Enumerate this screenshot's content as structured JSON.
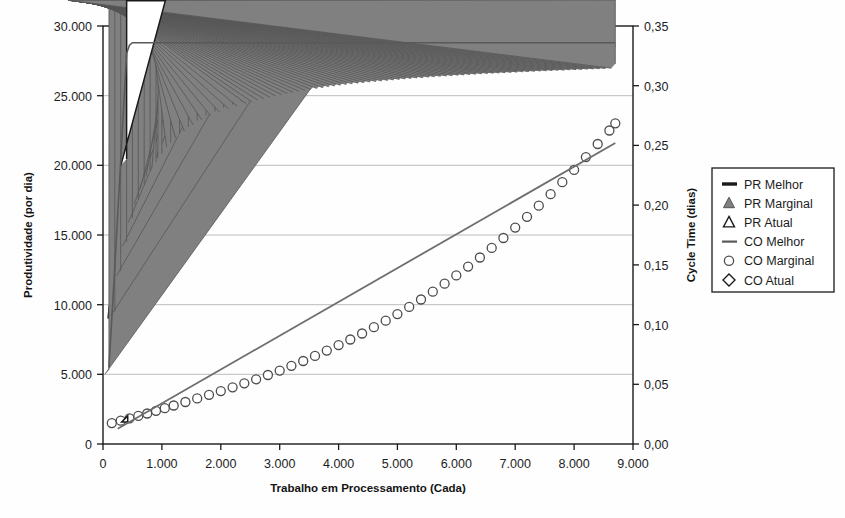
{
  "chart_data": {
    "type": "line",
    "title": "",
    "xlabel": "Trabalho em Processamento (Cada)",
    "ylabel": "Produtividade (por dia)",
    "y2label": "Cycle Time (dias)",
    "xlim": [
      0,
      9000
    ],
    "ylim": [
      0,
      30000
    ],
    "y2lim": [
      0.0,
      0.35
    ],
    "xticks": [
      0,
      1000,
      2000,
      3000,
      4000,
      5000,
      6000,
      7000,
      8000,
      9000
    ],
    "xticklabels": [
      "0",
      "1.000",
      "2.000",
      "3.000",
      "4.000",
      "5.000",
      "6.000",
      "7.000",
      "8.000",
      "9.000"
    ],
    "yticks": [
      0,
      5000,
      10000,
      15000,
      20000,
      25000,
      30000
    ],
    "yticklabels": [
      "0",
      "5.000",
      "10.000",
      "15.000",
      "20.000",
      "25.000",
      "30.000"
    ],
    "y2ticks": [
      0.0,
      0.05,
      0.1,
      0.15,
      0.2,
      0.25,
      0.3,
      0.35
    ],
    "y2ticklabels": [
      "0,00",
      "0,05",
      "0,10",
      "0,15",
      "0,20",
      "0,25",
      "0,30",
      "0,35"
    ],
    "grid": true,
    "grid_axis": "y",
    "legend_position": "right",
    "series": [
      {
        "name": "PR Melhor",
        "axis": "left",
        "style": "dashed-line",
        "color": "#1a1a1a",
        "x": [
          100,
          200,
          300,
          400,
          500,
          600,
          700,
          800,
          900,
          1000,
          1200,
          1400,
          1600,
          1800,
          2000,
          2400,
          2800,
          3200,
          3600,
          4000,
          4500,
          5000,
          5500,
          6000,
          6500,
          7000,
          7500,
          8000,
          8400,
          8700
        ],
        "y": [
          9000,
          13400,
          16600,
          19000,
          20800,
          22100,
          23100,
          23900,
          24500,
          25000,
          25700,
          26200,
          26550,
          26800,
          27000,
          27350,
          27600,
          27800,
          27950,
          28050,
          28170,
          28260,
          28330,
          28390,
          28440,
          28480,
          28520,
          28550,
          28580,
          28600
        ]
      },
      {
        "name": "PR Marginal",
        "axis": "left",
        "style": "filled-triangle",
        "color": "#808080",
        "x": [
          100,
          200,
          300,
          400,
          500,
          600,
          700,
          800,
          900,
          1000,
          1150,
          1300,
          1450,
          1600,
          1750,
          1900,
          2050,
          2200,
          2350,
          2500,
          2700,
          2900,
          3100,
          3300,
          3500,
          3700,
          3900,
          4100,
          4300,
          4500,
          4800,
          5100,
          5400,
          5700,
          6000,
          6300,
          6600,
          6900,
          7200,
          7500,
          7800,
          8100,
          8400,
          8700
        ],
        "y": [
          5000,
          9200,
          12100,
          14200,
          15900,
          17200,
          18300,
          19200,
          19900,
          20500,
          21300,
          21950,
          22450,
          22900,
          23250,
          23550,
          23820,
          24050,
          24250,
          24430,
          24680,
          24890,
          25080,
          25240,
          25390,
          25520,
          25640,
          25750,
          25850,
          25940,
          26060,
          26170,
          26270,
          26360,
          26440,
          26520,
          26590,
          26650,
          26710,
          26770,
          26820,
          26870,
          26920,
          26970
        ]
      },
      {
        "name": "PR Atual",
        "axis": "left",
        "style": "open-triangle",
        "color": "#1a1a1a",
        "x": [
          400
        ],
        "y": [
          20000
        ]
      },
      {
        "name": "CO Melhor",
        "axis": "right",
        "style": "solid-line",
        "color": "#595959",
        "x": [
          100,
          150,
          200,
          250,
          300,
          350,
          400,
          450,
          500,
          600,
          800,
          1000,
          2000,
          3000,
          4000,
          5000,
          6000,
          7000,
          8000,
          8700
        ],
        "y": [
          0.064,
          0.105,
          0.148,
          0.192,
          0.237,
          0.282,
          0.327,
          0.334,
          0.336,
          0.336,
          0.336,
          0.336,
          0.336,
          0.336,
          0.336,
          0.336,
          0.336,
          0.336,
          0.336,
          0.336
        ]
      },
      {
        "name": "CO Marginal",
        "axis": "right",
        "style": "open-circle",
        "color": "#4d4d4d",
        "x": [
          150,
          300,
          450,
          600,
          750,
          900,
          1050,
          1200,
          1400,
          1600,
          1800,
          2000,
          2200,
          2400,
          2600,
          2800,
          3000,
          3200,
          3400,
          3600,
          3800,
          4000,
          4200,
          4400,
          4600,
          4800,
          5000,
          5200,
          5400,
          5600,
          5800,
          6000,
          6200,
          6400,
          6600,
          6800,
          7000,
          7200,
          7400,
          7600,
          7800,
          8000,
          8200,
          8400,
          8600,
          8700
        ],
        "y": [
          0.0175,
          0.0195,
          0.0215,
          0.0235,
          0.0255,
          0.0278,
          0.03,
          0.0322,
          0.0352,
          0.0382,
          0.0412,
          0.0443,
          0.0475,
          0.0508,
          0.0542,
          0.0578,
          0.0615,
          0.0655,
          0.0695,
          0.0738,
          0.0782,
          0.0828,
          0.0875,
          0.0925,
          0.0978,
          0.1032,
          0.1088,
          0.1148,
          0.121,
          0.1275,
          0.1342,
          0.1412,
          0.1485,
          0.1562,
          0.1642,
          0.1725,
          0.1812,
          0.1902,
          0.1995,
          0.2092,
          0.2192,
          0.2295,
          0.2402,
          0.2512,
          0.2625,
          0.2685
        ]
      },
      {
        "name": "CO Atual",
        "axis": "right",
        "style": "open-diamond",
        "color": "#1a1a1a",
        "x": [
          420
        ],
        "y": [
          0.0185
        ]
      }
    ],
    "co_melhor_trend": {
      "x": [
        250,
        8700
      ],
      "y": [
        0.0128,
        0.252
      ]
    }
  },
  "legend": {
    "items": [
      {
        "label": "PR Melhor",
        "marker": "dash-marker-icon",
        "color": "#1a1a1a"
      },
      {
        "label": "PR Marginal",
        "marker": "filled-triangle-icon",
        "color": "#808080"
      },
      {
        "label": "PR Atual",
        "marker": "open-triangle-icon",
        "color": "#1a1a1a"
      },
      {
        "label": "CO Melhor",
        "marker": "solid-line-marker-icon",
        "color": "#595959"
      },
      {
        "label": "CO Marginal",
        "marker": "open-circle-icon",
        "color": "#4d4d4d"
      },
      {
        "label": "CO Atual",
        "marker": "open-diamond-icon",
        "color": "#1a1a1a"
      }
    ]
  },
  "colors": {
    "axis": "#1a1a1a",
    "grid": "#b4b4b4",
    "background": "#fefefe",
    "gray_series": "#808080",
    "dark_series": "#1a1a1a"
  }
}
